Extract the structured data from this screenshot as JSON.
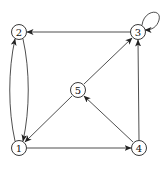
{
  "diagram": {
    "type": "directed-graph",
    "nodes": [
      {
        "id": "1",
        "label": "1",
        "x": 19,
        "y": 148
      },
      {
        "id": "2",
        "label": "2",
        "x": 19,
        "y": 32
      },
      {
        "id": "3",
        "label": "3",
        "x": 138,
        "y": 32
      },
      {
        "id": "4",
        "label": "4",
        "x": 139,
        "y": 148
      },
      {
        "id": "5",
        "label": "5",
        "x": 78,
        "y": 90
      }
    ],
    "edges": [
      {
        "from": "3",
        "to": "2"
      },
      {
        "from": "3",
        "to": "3",
        "self_loop": true
      },
      {
        "from": "1",
        "to": "2",
        "curved": true
      },
      {
        "from": "2",
        "to": "1",
        "curved": true
      },
      {
        "from": "1",
        "to": "4"
      },
      {
        "from": "4",
        "to": "3"
      },
      {
        "from": "4",
        "to": "5"
      },
      {
        "from": "5",
        "to": "3"
      },
      {
        "from": "5",
        "to": "1"
      }
    ],
    "colors": {
      "stroke": "#222222",
      "node_fill": "#ffffff"
    }
  }
}
